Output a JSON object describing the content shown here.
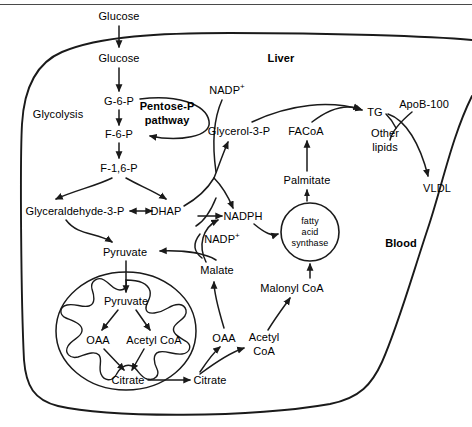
{
  "figure": {
    "compartments": {
      "liver": "Liver",
      "blood": "Blood",
      "mitochondrion": "mitochondrion",
      "pentose_pathway": "Pentose-P\npathway"
    },
    "colors": {
      "stroke": "#1a1a1a",
      "text": "#000000",
      "background": "#ffffff",
      "frame_rule": "#4a4a4a"
    }
  },
  "labels": {
    "glucose_blood": "Glucose",
    "glucose_liver": "Glucose",
    "g6p": "G-6-P",
    "glycolysis": "Glycolysis",
    "f6p": "F-6-P",
    "f16p": "F-1,6-P",
    "pentose_line1": "Pentose-P",
    "pentose_line2": "pathway",
    "glyceraldehyde3p": "Glyceraldehyde-3-P",
    "dhap": "DHAP",
    "pyruvate_cyto": "Pyruvate",
    "pyruvate_mito": "Pyruvate",
    "oaa_mito": "OAA",
    "acetylcoa_mito": "Acetyl CoA",
    "citrate_mito": "Citrate",
    "citrate_cyto": "Citrate",
    "oaa_cyto": "OAA",
    "acetylcoa_cyto_line1": "Acetyl",
    "acetylcoa_cyto_line2": "CoA",
    "malate": "Malate",
    "malonyl_coa": "Malonyl CoA",
    "fas_line1": "fatty",
    "fas_line2": "acid",
    "fas_line3": "synthase",
    "palmitate": "Palmitate",
    "facoa": "FACoA",
    "nadph": "NADPH",
    "nadp_plus_upper": "NADP",
    "nadp_plus_lower": "NADP",
    "nadp_superscript": "+",
    "glycerol3p": "Glycerol-3-P",
    "tg": "TG",
    "apob100": "ApoB-100",
    "other_lipids_line1": "Other",
    "other_lipids_line2": "lipids",
    "vldl": "VLDL",
    "liver": "Liver",
    "blood": "Blood"
  },
  "nodes": [
    {
      "id": "glucose_blood",
      "label": "Glucose",
      "x": 119,
      "y": 16,
      "compartment": "blood"
    },
    {
      "id": "glucose_liver",
      "label": "Glucose",
      "x": 119,
      "y": 58,
      "compartment": "liver"
    },
    {
      "id": "g6p",
      "label": "G-6-P",
      "x": 119,
      "y": 101,
      "compartment": "liver"
    },
    {
      "id": "glycolysis",
      "label": "Glycolysis",
      "x": 58,
      "y": 114,
      "compartment": "liver"
    },
    {
      "id": "pentose",
      "label": "Pentose-P pathway",
      "x": 167,
      "y": 114,
      "compartment": "liver",
      "bold": true
    },
    {
      "id": "f6p",
      "label": "F-6-P",
      "x": 119,
      "y": 134,
      "compartment": "liver"
    },
    {
      "id": "f16p",
      "label": "F-1,6-P",
      "x": 119,
      "y": 168,
      "compartment": "liver"
    },
    {
      "id": "glyceraldehyde3p",
      "label": "Glyceraldehyde-3-P",
      "x": 75,
      "y": 211,
      "compartment": "liver"
    },
    {
      "id": "dhap",
      "label": "DHAP",
      "x": 166,
      "y": 211,
      "compartment": "liver"
    },
    {
      "id": "nadph",
      "label": "NADPH",
      "x": 243,
      "y": 216,
      "compartment": "liver"
    },
    {
      "id": "nadp_upper",
      "label": "NADP+",
      "x": 227,
      "y": 90,
      "compartment": "liver"
    },
    {
      "id": "glycerol3p",
      "label": "Glycerol-3-P",
      "x": 239,
      "y": 131,
      "compartment": "liver"
    },
    {
      "id": "facoa",
      "label": "FACoA",
      "x": 306,
      "y": 131,
      "compartment": "liver"
    },
    {
      "id": "tg",
      "label": "TG",
      "x": 375,
      "y": 112,
      "compartment": "liver"
    },
    {
      "id": "apob100",
      "label": "ApoB-100",
      "x": 424,
      "y": 104,
      "compartment": "blood"
    },
    {
      "id": "other_lipids",
      "label": "Other lipids",
      "x": 385,
      "y": 140,
      "compartment": "liver"
    },
    {
      "id": "vldl",
      "label": "VLDL",
      "x": 437,
      "y": 188,
      "compartment": "blood"
    },
    {
      "id": "palmitate",
      "label": "Palmitate",
      "x": 307,
      "y": 180,
      "compartment": "liver"
    },
    {
      "id": "fatty_acid_synthase",
      "label": "fatty acid synthase",
      "x": 310,
      "y": 232,
      "compartment": "liver"
    },
    {
      "id": "nadp_lower",
      "label": "NADP+",
      "x": 222,
      "y": 239,
      "compartment": "liver"
    },
    {
      "id": "pyruvate_cyto",
      "label": "Pyruvate",
      "x": 125,
      "y": 252,
      "compartment": "liver"
    },
    {
      "id": "malate",
      "label": "Malate",
      "x": 217,
      "y": 270,
      "compartment": "liver"
    },
    {
      "id": "malonyl_coa",
      "label": "Malonyl CoA",
      "x": 292,
      "y": 288,
      "compartment": "liver"
    },
    {
      "id": "pyruvate_mito",
      "label": "Pyruvate",
      "x": 126,
      "y": 301,
      "compartment": "mitochondrion"
    },
    {
      "id": "oaa_mito",
      "label": "OAA",
      "x": 98,
      "y": 340,
      "compartment": "mitochondrion"
    },
    {
      "id": "acetylcoa_mito",
      "label": "Acetyl CoA",
      "x": 152,
      "y": 340,
      "compartment": "mitochondrion"
    },
    {
      "id": "oaa_cyto",
      "label": "OAA",
      "x": 224,
      "y": 338,
      "compartment": "liver"
    },
    {
      "id": "acetylcoa_cyto",
      "label": "Acetyl CoA",
      "x": 263,
      "y": 344,
      "compartment": "liver"
    },
    {
      "id": "citrate_mito",
      "label": "Citrate",
      "x": 128,
      "y": 380,
      "compartment": "mitochondrion"
    },
    {
      "id": "citrate_cyto",
      "label": "Citrate",
      "x": 208,
      "y": 380,
      "compartment": "liver"
    }
  ],
  "edges": [
    {
      "from": "glucose_blood",
      "to": "glucose_liver",
      "kind": "arrow"
    },
    {
      "from": "glucose_liver",
      "to": "g6p",
      "kind": "arrow"
    },
    {
      "from": "g6p",
      "to": "f6p",
      "kind": "arrow"
    },
    {
      "from": "g6p",
      "to": "f6p",
      "kind": "curve",
      "via": "pentose-P pathway"
    },
    {
      "from": "f6p",
      "to": "f16p",
      "kind": "arrow"
    },
    {
      "from": "f16p",
      "to": "glyceraldehyde3p",
      "kind": "arrow"
    },
    {
      "from": "f16p",
      "to": "dhap",
      "kind": "arrow"
    },
    {
      "from": "glyceraldehyde3p",
      "to": "dhap",
      "kind": "double-arrow"
    },
    {
      "from": "glyceraldehyde3p",
      "to": "pyruvate_cyto",
      "kind": "curve-arrow"
    },
    {
      "from": "dhap",
      "to": "glycerol3p",
      "kind": "curve-arrow"
    },
    {
      "from": "dhap",
      "to": "nadph",
      "kind": "curve-arrow"
    },
    {
      "from": "nadp_upper",
      "to": "glycerol3p",
      "kind": "curve"
    },
    {
      "from": "glycerol3p",
      "to": "tg",
      "kind": "curve-arrow"
    },
    {
      "from": "facoa",
      "to": "tg",
      "kind": "curve-arrow"
    },
    {
      "from": "tg",
      "to": "vldl",
      "kind": "curve-arrow"
    },
    {
      "from": "apob100",
      "to": "vldl",
      "kind": "curve"
    },
    {
      "from": "palmitate",
      "to": "facoa",
      "kind": "arrow"
    },
    {
      "from": "fatty_acid_synthase",
      "to": "palmitate",
      "kind": "arrow"
    },
    {
      "from": "malonyl_coa",
      "to": "fatty_acid_synthase",
      "kind": "arrow"
    },
    {
      "from": "acetylcoa_cyto",
      "to": "malonyl_coa",
      "kind": "curve-arrow"
    },
    {
      "from": "nadph",
      "to": "fatty_acid_synthase",
      "kind": "curve-arrow"
    },
    {
      "from": "malate",
      "to": "nadph",
      "kind": "curve-arrow"
    },
    {
      "from": "malate",
      "to": "pyruvate_cyto",
      "kind": "curve-arrow"
    },
    {
      "from": "nadp_lower",
      "to": "malate",
      "kind": "curve"
    },
    {
      "from": "oaa_cyto",
      "to": "malate",
      "kind": "curve-arrow"
    },
    {
      "from": "pyruvate_cyto",
      "to": "pyruvate_mito",
      "kind": "arrow"
    },
    {
      "from": "pyruvate_mito",
      "to": "oaa_mito",
      "kind": "arrow"
    },
    {
      "from": "pyruvate_mito",
      "to": "acetylcoa_mito",
      "kind": "arrow"
    },
    {
      "from": "oaa_mito",
      "to": "citrate_mito",
      "kind": "arrow"
    },
    {
      "from": "acetylcoa_mito",
      "to": "citrate_mito",
      "kind": "arrow"
    },
    {
      "from": "citrate_mito",
      "to": "citrate_cyto",
      "kind": "arrow"
    },
    {
      "from": "citrate_cyto",
      "to": "oaa_cyto",
      "kind": "arrow"
    },
    {
      "from": "citrate_cyto",
      "to": "acetylcoa_cyto",
      "kind": "arrow"
    }
  ]
}
